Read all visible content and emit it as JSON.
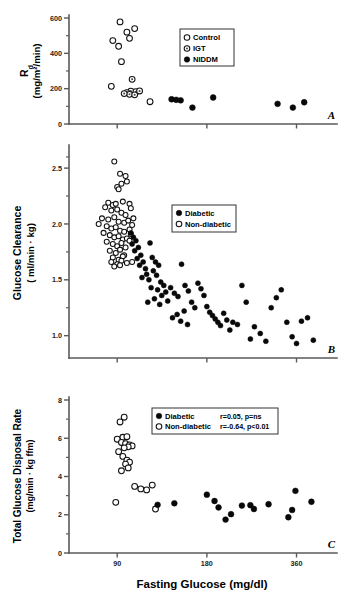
{
  "figure": {
    "x_axis": {
      "label": "Fasting Glucose (mg/dl)",
      "ticks": [
        "90",
        "180",
        "360"
      ],
      "tick_values": [
        90,
        180,
        360
      ],
      "scale": "log",
      "range": [
        62,
        470
      ]
    },
    "panels": [
      {
        "letter": "A",
        "y_label_main": "R",
        "y_label_sub": "d",
        "y_label_units": "(mg/m²/min)",
        "y_ticks": [
          "0",
          "200",
          "400",
          "600"
        ],
        "legend": [
          {
            "marker": "open-circle",
            "label": "Control"
          },
          {
            "marker": "dotted-circle",
            "label": "IGT"
          },
          {
            "marker": "filled-circle",
            "label": "NIDDM"
          }
        ]
      },
      {
        "letter": "B",
        "y_label_main": "Glucose Clearance",
        "y_label_units": "( ml/min · kg)",
        "y_ticks": [
          "1.0",
          "1.5",
          "2.0",
          "2.5"
        ],
        "legend": [
          {
            "marker": "filled-circle",
            "label": "Diabetic"
          },
          {
            "marker": "open-circle",
            "label": "Non-diabetic"
          }
        ]
      },
      {
        "letter": "C",
        "y_label_main": "Total Glucose Disposal Rate",
        "y_label_units": "(mg/min · kg ffm)",
        "y_ticks": [
          "0",
          "2",
          "4",
          "6",
          "8"
        ],
        "legend": [
          {
            "marker": "filled-circle",
            "label": "Diabetic",
            "stat": "r=0.05, p=ns"
          },
          {
            "marker": "open-circle",
            "label": "Non-diabetic",
            "stat": "r=-0.64, p<0.01"
          }
        ]
      }
    ]
  },
  "chart_data": [
    {
      "type": "scatter",
      "panel": "A",
      "title": "",
      "xlabel": "Fasting Glucose (mg/dl)",
      "ylabel": "Rd (mg/m2/min)",
      "xlim": [
        62,
        470
      ],
      "xscale": "log",
      "ylim": [
        0,
        600
      ],
      "grid": false,
      "legend_position": "upper-center",
      "series": [
        {
          "name": "Control",
          "marker": "open-circle",
          "points": [
            [
              92,
              578
            ],
            [
              87,
              472
            ],
            [
              97,
              520
            ],
            [
              103,
              540
            ],
            [
              99,
              485
            ],
            [
              91,
              440
            ],
            [
              93,
              353
            ],
            [
              86,
              213
            ],
            [
              116,
              126
            ]
          ]
        },
        {
          "name": "IGT",
          "marker": "dotted-circle",
          "points": [
            [
              101,
              253
            ],
            [
              100,
              186
            ],
            [
              104,
              183
            ],
            [
              97,
              178
            ],
            [
              99,
              168
            ],
            [
              103,
              165
            ],
            [
              95,
              172
            ],
            [
              107,
              187
            ]
          ]
        },
        {
          "name": "NIDDM",
          "marker": "filled-circle",
          "points": [
            [
              137,
              140
            ],
            [
              142,
              137
            ],
            [
              147,
              134
            ],
            [
              161,
              93
            ],
            [
              189,
              150
            ],
            [
              311,
              114
            ],
            [
              350,
              93
            ],
            [
              382,
              123
            ]
          ]
        }
      ]
    },
    {
      "type": "scatter",
      "panel": "B",
      "title": "",
      "xlabel": "Fasting Glucose (mg/dl)",
      "ylabel": "Glucose Clearance (ml/min . kg)",
      "xlim": [
        62,
        470
      ],
      "xscale": "log",
      "ylim": [
        0.8,
        2.65
      ],
      "grid": false,
      "legend_position": "upper-center",
      "series": [
        {
          "name": "Non-diabetic",
          "marker": "open-circle",
          "points": [
            [
              88,
              2.56
            ],
            [
              92,
              2.45
            ],
            [
              96,
              2.43
            ],
            [
              97,
              2.38
            ],
            [
              93,
              2.36
            ],
            [
              90,
              2.33
            ],
            [
              91,
              2.31
            ],
            [
              84,
              2.19
            ],
            [
              87,
              2.17
            ],
            [
              89,
              2.18
            ],
            [
              94,
              2.2
            ],
            [
              99,
              2.18
            ],
            [
              82,
              2.15
            ],
            [
              86,
              2.12
            ],
            [
              90,
              2.13
            ],
            [
              93,
              2.1
            ],
            [
              96,
              2.08
            ],
            [
              100,
              2.14
            ],
            [
              80,
              2.05
            ],
            [
              84,
              2.04
            ],
            [
              88,
              2.06
            ],
            [
              91,
              2.02
            ],
            [
              95,
              2.01
            ],
            [
              98,
              2.03
            ],
            [
              102,
              2.05
            ],
            [
              78,
              2.0
            ],
            [
              83,
              1.98
            ],
            [
              86,
              1.96
            ],
            [
              89,
              1.97
            ],
            [
              92,
              1.94
            ],
            [
              95,
              1.93
            ],
            [
              99,
              1.95
            ],
            [
              101,
              1.99
            ],
            [
              81,
              1.92
            ],
            [
              85,
              1.9
            ],
            [
              88,
              1.88
            ],
            [
              91,
              1.89
            ],
            [
              94,
              1.86
            ],
            [
              97,
              1.87
            ],
            [
              100,
              1.91
            ],
            [
              83,
              1.84
            ],
            [
              87,
              1.82
            ],
            [
              90,
              1.8
            ],
            [
              93,
              1.83
            ],
            [
              96,
              1.79
            ],
            [
              99,
              1.85
            ],
            [
              85,
              1.76
            ],
            [
              89,
              1.74
            ],
            [
              92,
              1.77
            ],
            [
              95,
              1.72
            ],
            [
              87,
              1.7
            ],
            [
              91,
              1.68
            ],
            [
              94,
              1.71
            ],
            [
              86,
              1.66
            ],
            [
              90,
              1.64
            ],
            [
              93,
              1.67
            ],
            [
              88,
              1.62
            ],
            [
              92,
              1.63
            ],
            [
              97,
              1.65
            ],
            [
              101,
              1.66
            ]
          ]
        },
        {
          "name": "Diabetic",
          "marker": "filled-circle",
          "points": [
            [
              100,
              1.92
            ],
            [
              102,
              1.88
            ],
            [
              104,
              1.85
            ],
            [
              101,
              1.82
            ],
            [
              106,
              1.79
            ],
            [
              103,
              1.76
            ],
            [
              108,
              1.72
            ],
            [
              105,
              1.69
            ],
            [
              110,
              1.66
            ],
            [
              107,
              1.63
            ],
            [
              112,
              1.6
            ],
            [
              116,
              1.83
            ],
            [
              118,
              1.7
            ],
            [
              121,
              1.66
            ],
            [
              124,
              1.63
            ],
            [
              119,
              1.58
            ],
            [
              113,
              1.55
            ],
            [
              109,
              1.52
            ],
            [
              115,
              1.5
            ],
            [
              122,
              1.54
            ],
            [
              126,
              1.48
            ],
            [
              129,
              1.45
            ],
            [
              117,
              1.43
            ],
            [
              123,
              1.41
            ],
            [
              131,
              1.39
            ],
            [
              127,
              1.36
            ],
            [
              120,
              1.33
            ],
            [
              114,
              1.3
            ],
            [
              125,
              1.28
            ],
            [
              133,
              1.31
            ],
            [
              136,
              1.43
            ],
            [
              140,
              1.38
            ],
            [
              144,
              1.35
            ],
            [
              148,
              1.64
            ],
            [
              152,
              1.45
            ],
            [
              156,
              1.4
            ],
            [
              160,
              1.3
            ],
            [
              164,
              1.25
            ],
            [
              151,
              1.22
            ],
            [
              143,
              1.19
            ],
            [
              138,
              1.16
            ],
            [
              147,
              1.13
            ],
            [
              155,
              1.1
            ],
            [
              168,
              1.47
            ],
            [
              172,
              1.42
            ],
            [
              176,
              1.36
            ],
            [
              180,
              1.26
            ],
            [
              184,
              1.21
            ],
            [
              188,
              1.18
            ],
            [
              192,
              1.15
            ],
            [
              196,
              1.12
            ],
            [
              200,
              1.09
            ],
            [
              205,
              1.2
            ],
            [
              210,
              1.14
            ],
            [
              215,
              1.05
            ],
            [
              220,
              1.12
            ],
            [
              228,
              1.1
            ],
            [
              236,
              1.45
            ],
            [
              244,
              1.3
            ],
            [
              252,
              0.97
            ],
            [
              260,
              1.08
            ],
            [
              272,
              1.02
            ],
            [
              284,
              0.95
            ],
            [
              296,
              1.25
            ],
            [
              308,
              1.34
            ],
            [
              320,
              1.41
            ],
            [
              334,
              1.12
            ],
            [
              348,
              0.99
            ],
            [
              360,
              0.93
            ],
            [
              374,
              1.13
            ],
            [
              392,
              1.16
            ],
            [
              410,
              0.96
            ]
          ]
        }
      ]
    },
    {
      "type": "scatter",
      "panel": "C",
      "title": "",
      "xlabel": "Fasting Glucose (mg/dl)",
      "ylabel": "Total Glucose Disposal Rate (mg/min . kg ffm)",
      "xlim": [
        62,
        470
      ],
      "xscale": "log",
      "ylim": [
        0,
        8
      ],
      "grid": false,
      "legend_position": "upper-center",
      "annotations": [
        "Diabetic r=0.05, p=ns",
        "Non-diabetic r=-0.64, p<0.01"
      ],
      "series": [
        {
          "name": "Non-diabetic",
          "marker": "open-circle",
          "points": [
            [
              95,
              7.1
            ],
            [
              92,
              6.85
            ],
            [
              94,
              6.05
            ],
            [
              90,
              5.95
            ],
            [
              97,
              6.08
            ],
            [
              93,
              5.78
            ],
            [
              96,
              5.72
            ],
            [
              99,
              5.65
            ],
            [
              101,
              5.6
            ],
            [
              98,
              5.55
            ],
            [
              95,
              5.5
            ],
            [
              91,
              5.3
            ],
            [
              94,
              5.05
            ],
            [
              97,
              4.85
            ],
            [
              99,
              4.75
            ],
            [
              96,
              4.65
            ],
            [
              98,
              4.45
            ],
            [
              93,
              4.3
            ],
            [
              103,
              3.48
            ],
            [
              108,
              3.35
            ],
            [
              113,
              3.3
            ],
            [
              118,
              3.55
            ],
            [
              89,
              2.65
            ],
            [
              121,
              2.3
            ]
          ]
        },
        {
          "name": "Diabetic",
          "marker": "filled-circle",
          "points": [
            [
              123,
              2.52
            ],
            [
              140,
              2.6
            ],
            [
              180,
              3.05
            ],
            [
              191,
              2.72
            ],
            [
              197,
              2.38
            ],
            [
              208,
              1.75
            ],
            [
              217,
              2.03
            ],
            [
              236,
              2.48
            ],
            [
              252,
              2.5
            ],
            [
              259,
              2.3
            ],
            [
              290,
              2.55
            ],
            [
              338,
              1.87
            ],
            [
              348,
              2.25
            ],
            [
              357,
              3.25
            ],
            [
              404,
              2.68
            ]
          ]
        }
      ]
    }
  ]
}
